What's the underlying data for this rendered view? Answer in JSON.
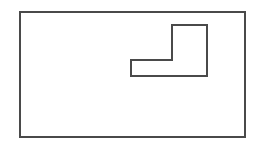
{
  "figure": {
    "kind": "line-drawing",
    "canvas": {
      "width": 263,
      "height": 153,
      "background_color": "#ffffff"
    },
    "stroke": {
      "color": "#4a4a4a",
      "width": 1.4,
      "linejoin": "miter",
      "linecap": "square"
    },
    "shapes": [
      {
        "name": "outer-rectangle",
        "type": "rectangle",
        "fill": "none",
        "x": 20,
        "y": 12,
        "width": 225,
        "height": 125,
        "points": "20,12 245,12 245,137 20,137",
        "path": "M 20 12 L 245 12 L 245 137 L 20 137 Z"
      },
      {
        "name": "inner-l-shape",
        "type": "polygon",
        "fill": "none",
        "vertex_count": 6,
        "points": "172,25 207,25 207,76 131,76 131,60 172,60",
        "path": "M 172 25 L 207 25 L 207 76 L 131 76 L 131 60 L 172 60 Z"
      }
    ]
  }
}
